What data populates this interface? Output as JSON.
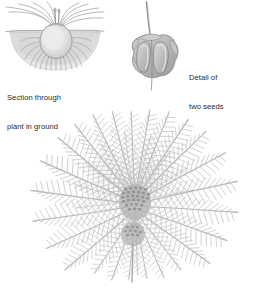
{
  "page": {
    "background_color": "#ffffff",
    "style": "grayscale pencil/engraving illustration",
    "width": 270,
    "height": 295
  },
  "palette": {
    "background": "#ffffff",
    "ink_dark": "#2b2b2b",
    "outline": "#8a8a8a",
    "outline_soft": "#a9a9a9",
    "fill_light": "#e3e3e3",
    "fill_mid": "#cfcfcf",
    "fill_dark": "#b4b4b4",
    "soil": "#dcdcdc",
    "frond": "#b9b9b9",
    "frond_light": "#d2d2d2",
    "crown": "#9d9d9d"
  },
  "figures": [
    {
      "id": "section",
      "name": "section-through-plant-in-ground",
      "caption_lines": [
        "Section through",
        "plant in ground"
      ],
      "description": "Cutaway view of a rounded bulb/caudex set in a mound of soil, with fibrous roots below and arching leaves above",
      "parts": {
        "bulb": "rounded ovate caudex",
        "soil_mound": "semicircular ground mass",
        "ground_line": "horizontal soil surface line",
        "roots": "radiating fibrous roots",
        "leaves": "arching strap leaves",
        "shoots": "two upright central shoots"
      },
      "leaf_count": 10,
      "root_count": 17
    },
    {
      "id": "seeds",
      "name": "detail-of-two-seeds",
      "caption_lines": [
        "Detail of",
        "two seeds"
      ],
      "description": "Enlarged pair of seeds enclosed in a lobed capsule with a long curved awn rising from the top",
      "parts": {
        "seed_left": "left seed body",
        "seed_right": "right seed body",
        "capsule": "surrounding bract/capsule wall",
        "awn": "long curved bristle"
      },
      "seed_count": 2
    },
    {
      "id": "plant",
      "name": "whole-plant-rosette",
      "caption_lines": [],
      "description": "Whole plant seen from above: a rosette of long pinnate feathery fronds radiating from a scaly central crown",
      "parts": {
        "crown": "scaly central crown",
        "fronds": "pinnate radiating fronds",
        "stem_base": "short basal stem"
      },
      "frond_count": 26
    }
  ],
  "captions": {
    "section": {
      "line1": "Section through",
      "line2": "plant in ground"
    },
    "seeds": {
      "line1": "Detail of",
      "line2": "two seeds"
    }
  }
}
